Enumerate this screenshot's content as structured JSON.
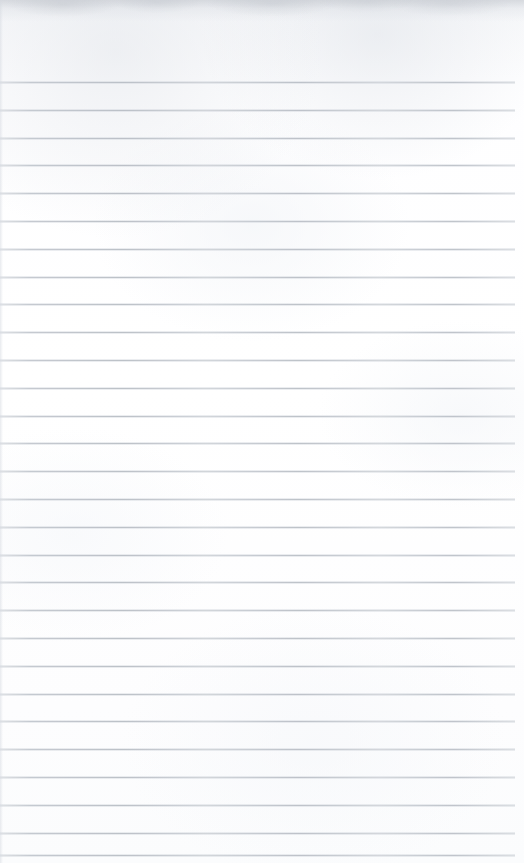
{
  "document": {
    "type": "scanned-page",
    "subject": "blank lined notebook paper",
    "page_width": 524,
    "page_height": 863,
    "paper_color": "#fefeff",
    "has_visible_text": false,
    "has_handwriting": false,
    "visible_text": ""
  },
  "ruling": {
    "line_color": "#c2c7ce",
    "line_thickness_px": 1,
    "line_spacing_px": 27.8,
    "line_count": 28,
    "first_line_y": 82,
    "last_line_y": 855,
    "line_start_x": 0,
    "line_end_x": 515,
    "right_margin_px": 9,
    "top_margin_px": 82,
    "bottom_margin_px": 8,
    "lines": [
      {
        "index": 1,
        "y": 82
      },
      {
        "index": 2,
        "y": 110
      },
      {
        "index": 3,
        "y": 138
      },
      {
        "index": 4,
        "y": 165
      },
      {
        "index": 5,
        "y": 193
      },
      {
        "index": 6,
        "y": 221
      },
      {
        "index": 7,
        "y": 249
      },
      {
        "index": 8,
        "y": 277
      },
      {
        "index": 9,
        "y": 304
      },
      {
        "index": 10,
        "y": 332
      },
      {
        "index": 11,
        "y": 360
      },
      {
        "index": 12,
        "y": 388
      },
      {
        "index": 13,
        "y": 416
      },
      {
        "index": 14,
        "y": 443
      },
      {
        "index": 15,
        "y": 471
      },
      {
        "index": 16,
        "y": 499
      },
      {
        "index": 17,
        "y": 527
      },
      {
        "index": 18,
        "y": 555
      },
      {
        "index": 19,
        "y": 582
      },
      {
        "index": 20,
        "y": 610
      },
      {
        "index": 21,
        "y": 638
      },
      {
        "index": 22,
        "y": 666
      },
      {
        "index": 23,
        "y": 694
      },
      {
        "index": 24,
        "y": 721
      },
      {
        "index": 25,
        "y": 749
      },
      {
        "index": 26,
        "y": 777
      },
      {
        "index": 27,
        "y": 805
      },
      {
        "index": 28,
        "y": 833
      },
      {
        "index": 29,
        "y": 855
      }
    ]
  },
  "artifacts": {
    "top_edge_shadow": true,
    "top_edge_shadow_color": "#c4c8cf",
    "left_edge_artifact": true,
    "left_edge_artifact_color": "#d6dae1",
    "paper_mottling": true
  }
}
